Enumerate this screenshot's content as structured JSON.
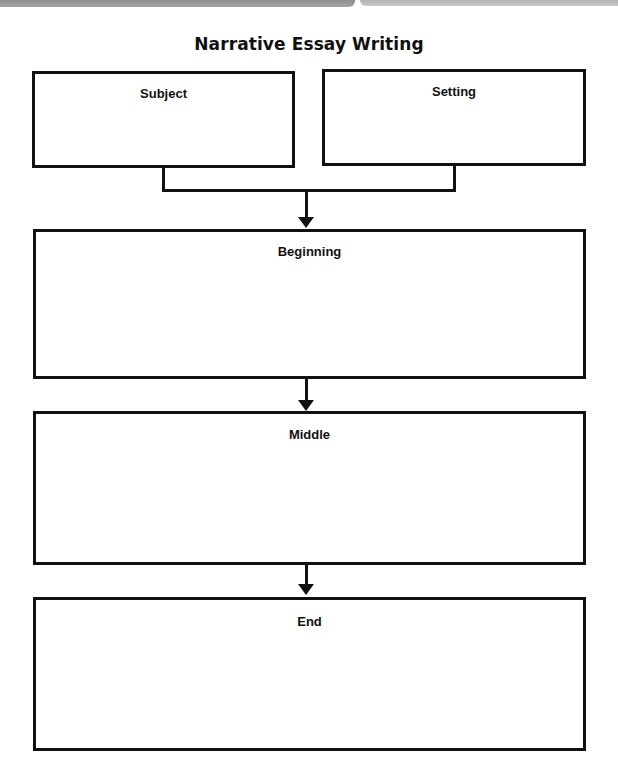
{
  "title": "Narrative Essay Writing",
  "boxes": {
    "subject": {
      "label": "Subject"
    },
    "setting": {
      "label": "Setting"
    },
    "beginning": {
      "label": "Beginning"
    },
    "middle": {
      "label": "Middle"
    },
    "end": {
      "label": "End"
    }
  },
  "colors": {
    "border": "#111111",
    "background": "#ffffff",
    "topbar": "#9a9a9a"
  }
}
